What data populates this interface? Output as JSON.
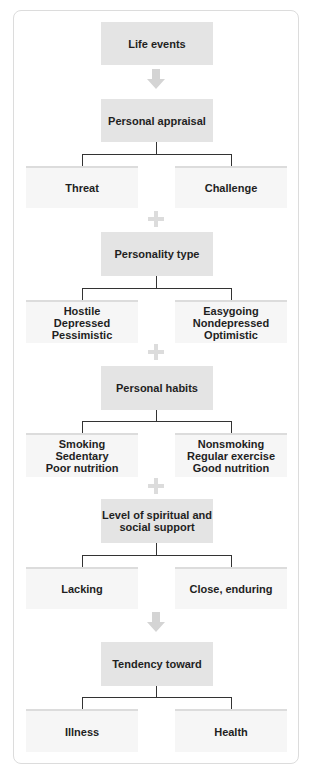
{
  "diagram": {
    "type": "flowchart",
    "colors": {
      "main_box": "#e4e4e4",
      "option_box": "#f6f6f6",
      "connector": "#333333",
      "arrow_plus": "#dcdcdc",
      "frame": "#dcdcdc"
    },
    "stages": [
      {
        "title": "Life events",
        "connector_after": "arrow"
      },
      {
        "title": "Personal appraisal",
        "options": [
          "Threat",
          "Challenge"
        ],
        "connector_after": "plus"
      },
      {
        "title": "Personality type",
        "options": [
          "Hostile\nDepressed\nPessimistic",
          "Easygoing\nNondepressed\nOptimistic"
        ],
        "connector_after": "plus"
      },
      {
        "title": "Personal habits",
        "options": [
          "Smoking\nSedentary\nPoor nutrition",
          "Nonsmoking\nRegular exercise\nGood nutrition"
        ],
        "connector_after": "plus"
      },
      {
        "title": "Level of spiritual and\nsocial support",
        "options": [
          "Lacking",
          "Close, enduring"
        ],
        "connector_after": "arrow"
      },
      {
        "title": "Tendency toward",
        "options": [
          "Illness",
          "Health"
        ]
      }
    ]
  }
}
